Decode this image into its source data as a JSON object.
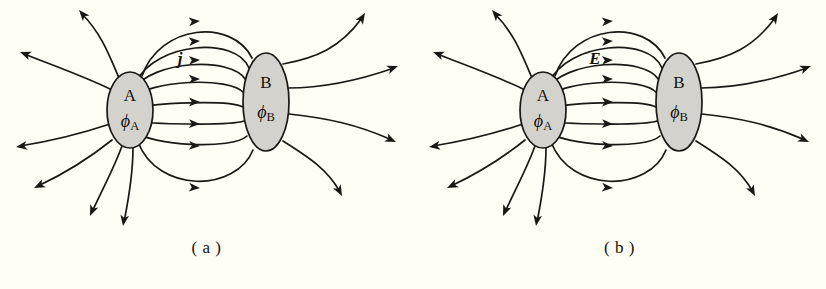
{
  "figure": {
    "background_color": "#fffef5",
    "ink_color": "#1a1814",
    "blob_fill_color": "#d3d2cd",
    "panels": [
      {
        "id": "a",
        "caption": "( a )",
        "field_label": "j",
        "field_label_meaning": "current-density-vector",
        "nodes": [
          {
            "id": "A",
            "name": "A",
            "potential": "ϕ",
            "potential_subscript": "A"
          },
          {
            "id": "B",
            "name": "B",
            "potential": "ϕ",
            "potential_subscript": "B"
          }
        ],
        "interior_field_line_count": 8,
        "exterior_field_line_count": 10,
        "field_direction": "A to B (left to right)"
      },
      {
        "id": "b",
        "caption": "( b )",
        "field_label": "E",
        "field_label_meaning": "electric-field-vector",
        "nodes": [
          {
            "id": "A",
            "name": "A",
            "potential": "ϕ",
            "potential_subscript": "A"
          },
          {
            "id": "B",
            "name": "B",
            "potential": "ϕ",
            "potential_subscript": "B"
          }
        ],
        "interior_field_line_count": 8,
        "exterior_field_line_count": 10,
        "field_direction": "A to B (left to right)"
      }
    ]
  }
}
